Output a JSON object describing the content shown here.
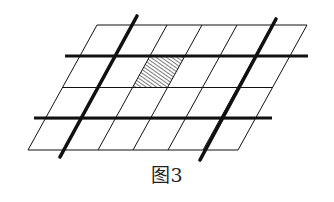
{
  "figure": {
    "caption": "图3",
    "colors": {
      "line": "#111111",
      "background": "#ffffff",
      "hatch": "#333333"
    },
    "grid": {
      "rows": 4,
      "cols": 6,
      "top_left": [
        97,
        25
      ],
      "cell_width": 35,
      "row_height": 31.25,
      "row_shift_x": -17.25
    },
    "hatched_cell": {
      "row": 1,
      "col": 2
    },
    "thick_horizontal_lines": [
      {
        "y": 56,
        "x1": 65,
        "x2": 308
      },
      {
        "y": 118,
        "x1": 34,
        "x2": 272
      }
    ],
    "thick_slanted_lines": [
      {
        "x1": 137,
        "y1": 16,
        "x2": 60,
        "y2": 157
      },
      {
        "x1": 276,
        "y1": 19,
        "x2": 200,
        "y2": 160
      }
    ]
  }
}
